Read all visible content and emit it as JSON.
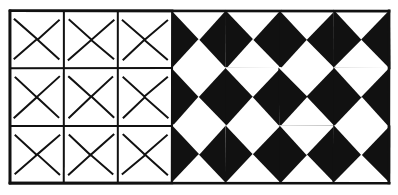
{
  "figure": {
    "width": 398,
    "height": 195,
    "background_color": "#ffffff",
    "ink_color": "#111111"
  },
  "grid": {
    "columns": 7,
    "rows": 3,
    "left_px": 10,
    "top_px": 11,
    "right_px": 389,
    "bottom_px": 183,
    "column_edges": [
      10,
      64,
      118,
      172,
      226,
      280,
      334,
      389
    ],
    "row_edges": [
      11,
      68,
      126,
      183
    ],
    "outline_stroke_width": 2.0,
    "border_stroke_width": 2.6,
    "outline_columns": [
      1,
      2,
      3
    ],
    "filled_columns": [
      4,
      5,
      6,
      7
    ]
  },
  "motifs": {
    "horizontal_name": "horizontal-bowtie",
    "vertical_name": "vertical-bowtie",
    "horizontal_symbol": "bowtie-lying",
    "vertical_symbol": "bowtie-upright"
  },
  "cells": [
    [
      {
        "col": 1,
        "row": 1,
        "style": "outline",
        "motif": "horizontal",
        "bg": "#ffffff",
        "fg": "#111111"
      },
      {
        "col": 2,
        "row": 1,
        "style": "outline",
        "motif": "vertical",
        "bg": "#ffffff",
        "fg": "#111111"
      },
      {
        "col": 3,
        "row": 1,
        "style": "outline",
        "motif": "horizontal",
        "bg": "#ffffff",
        "fg": "#111111"
      },
      {
        "col": 4,
        "row": 1,
        "style": "filled",
        "motif": "vertical",
        "bg": "#111111",
        "fg": "#ffffff"
      },
      {
        "col": 5,
        "row": 1,
        "style": "filled",
        "motif": "horizontal",
        "bg": "#ffffff",
        "fg": "#111111"
      },
      {
        "col": 6,
        "row": 1,
        "style": "filled",
        "motif": "vertical",
        "bg": "#111111",
        "fg": "#ffffff"
      },
      {
        "col": 7,
        "row": 1,
        "style": "filled",
        "motif": "horizontal",
        "bg": "#ffffff",
        "fg": "#111111"
      }
    ],
    [
      {
        "col": 1,
        "row": 2,
        "style": "outline",
        "motif": "vertical",
        "bg": "#ffffff",
        "fg": "#111111"
      },
      {
        "col": 2,
        "row": 2,
        "style": "outline",
        "motif": "horizontal",
        "bg": "#ffffff",
        "fg": "#111111"
      },
      {
        "col": 3,
        "row": 2,
        "style": "outline",
        "motif": "vertical",
        "bg": "#ffffff",
        "fg": "#111111"
      },
      {
        "col": 4,
        "row": 2,
        "style": "filled",
        "motif": "horizontal",
        "bg": "#ffffff",
        "fg": "#111111"
      },
      {
        "col": 5,
        "row": 2,
        "style": "filled",
        "motif": "vertical",
        "bg": "#111111",
        "fg": "#ffffff"
      },
      {
        "col": 6,
        "row": 2,
        "style": "filled",
        "motif": "horizontal",
        "bg": "#ffffff",
        "fg": "#111111"
      },
      {
        "col": 7,
        "row": 2,
        "style": "filled",
        "motif": "vertical",
        "bg": "#111111",
        "fg": "#ffffff"
      }
    ],
    [
      {
        "col": 1,
        "row": 3,
        "style": "outline",
        "motif": "horizontal",
        "bg": "#ffffff",
        "fg": "#111111"
      },
      {
        "col": 2,
        "row": 3,
        "style": "outline",
        "motif": "vertical",
        "bg": "#ffffff",
        "fg": "#111111"
      },
      {
        "col": 3,
        "row": 3,
        "style": "outline",
        "motif": "horizontal",
        "bg": "#ffffff",
        "fg": "#111111"
      },
      {
        "col": 4,
        "row": 3,
        "style": "filled",
        "motif": "vertical",
        "bg": "#111111",
        "fg": "#ffffff"
      },
      {
        "col": 5,
        "row": 3,
        "style": "filled",
        "motif": "horizontal",
        "bg": "#ffffff",
        "fg": "#111111"
      },
      {
        "col": 6,
        "row": 3,
        "style": "filled",
        "motif": "vertical",
        "bg": "#111111",
        "fg": "#ffffff"
      },
      {
        "col": 7,
        "row": 3,
        "style": "filled",
        "motif": "horizontal",
        "bg": "#ffffff",
        "fg": "#111111"
      }
    ]
  ]
}
